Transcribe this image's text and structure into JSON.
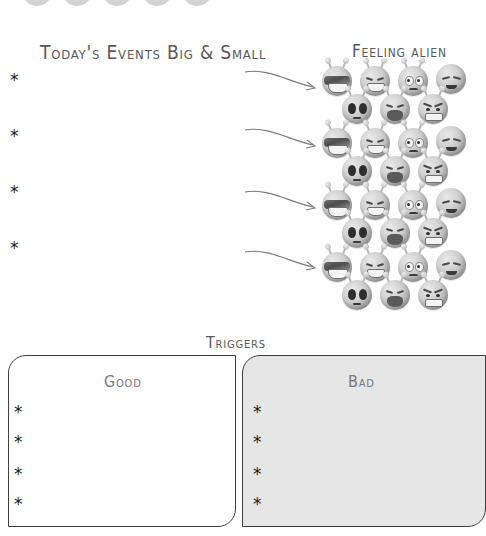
{
  "page": {
    "background_color": "#ffffff",
    "ink_color": "#3a3a3a"
  },
  "sections": {
    "events": {
      "title": "Today's Events Big & Small",
      "bullets": [
        "*",
        "*",
        "*",
        "*"
      ]
    },
    "feeling": {
      "title": "Feeling alien",
      "groups": [
        {
          "faces": [
            "shades-grin",
            "laughing",
            "sad-frown",
            "weary-droop",
            "teary-eyes",
            "crying-open",
            "angry-grimace"
          ]
        },
        {
          "faces": [
            "shades-grin",
            "laughing",
            "sad-frown",
            "weary-droop",
            "teary-eyes",
            "crying-open",
            "angry-grimace"
          ]
        },
        {
          "faces": [
            "shades-grin",
            "laughing",
            "sad-frown",
            "weary-droop",
            "teary-eyes",
            "crying-open",
            "angry-grimace"
          ]
        },
        {
          "faces": [
            "shades-grin",
            "laughing",
            "sad-frown",
            "weary-droop",
            "teary-eyes",
            "crying-open",
            "angry-grimace"
          ]
        }
      ],
      "arrow_count": 4
    },
    "triggers": {
      "title": "Triggers",
      "good": {
        "label": "Good",
        "bullets": [
          "*",
          "*",
          "*",
          "*"
        ],
        "fill_color": "#ffffff"
      },
      "bad": {
        "label": "Bad",
        "bullets": [
          "*",
          "*",
          "*",
          "*"
        ],
        "fill_color": "#e6e6e6"
      }
    }
  }
}
